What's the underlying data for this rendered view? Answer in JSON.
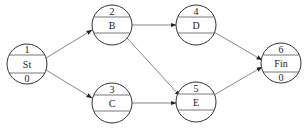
{
  "diagram": {
    "type": "activity-on-node network",
    "nodes": [
      {
        "id": "1",
        "number": "1",
        "name": "St",
        "bottom": "0",
        "cx": 27,
        "cy": 64
      },
      {
        "id": "2",
        "number": "2",
        "name": "B",
        "bottom": "",
        "cx": 112,
        "cy": 25
      },
      {
        "id": "3",
        "number": "3",
        "name": "C",
        "bottom": "",
        "cx": 112,
        "cy": 103
      },
      {
        "id": "4",
        "number": "4",
        "name": "D",
        "bottom": "",
        "cx": 196,
        "cy": 25
      },
      {
        "id": "5",
        "number": "5",
        "name": "E",
        "bottom": "",
        "cx": 196,
        "cy": 102
      },
      {
        "id": "6",
        "number": "6",
        "name": "Fin",
        "bottom": "0",
        "cx": 281,
        "cy": 63
      }
    ],
    "edges": [
      {
        "from": "1",
        "to": "2"
      },
      {
        "from": "1",
        "to": "3"
      },
      {
        "from": "2",
        "to": "4"
      },
      {
        "from": "2",
        "to": "5"
      },
      {
        "from": "3",
        "to": "5"
      },
      {
        "from": "4",
        "to": "6"
      },
      {
        "from": "5",
        "to": "6"
      }
    ]
  }
}
